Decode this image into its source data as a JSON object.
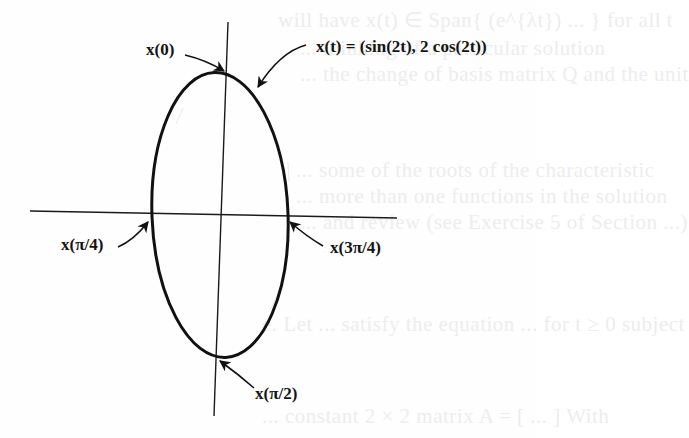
{
  "figure": {
    "curve_equation": "x(t) = (sin(2t), 2 cos(2t))",
    "labels": {
      "top": "x(0)",
      "left": "x(π/4)",
      "bottom": "x(π/2)",
      "right": "x(3π/4)",
      "equation": "x(t) = (sin(2t), 2 cos(2t))"
    },
    "direction": "clockwise",
    "arrow_count": 4,
    "colors": {
      "ink": "#111111",
      "paper": "#fefefe",
      "show_through": "#ededed"
    }
  },
  "background_bleed": {
    "lines": [
      "will have x(t) ∈ Span{ (e^{λt}) ... } for all t",
      "... thinking of a particular solution",
      "... the change of basis matrix Q and the unit",
      "... some of the roots of the characteristic",
      "... more than one functions in the solution",
      "... and review (see Exercise 5 of Section ...)",
      "e.  Let ... satisfy the equation ... for t ≥ 0 subject",
      "... constant 2 × 2 matrix A = [ ... ] With"
    ]
  }
}
